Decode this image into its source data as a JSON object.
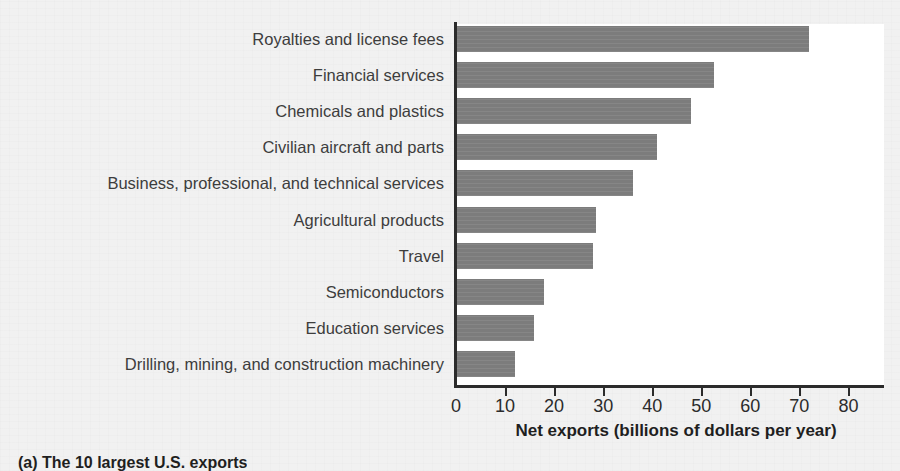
{
  "caption": "(a) The 10 largest U.S. exports",
  "axis": {
    "x_title": "Net exports (billions of dollars per year)",
    "ticks": [
      0,
      10,
      20,
      30,
      40,
      50,
      60,
      70,
      80
    ]
  },
  "colors": {
    "bar_fill": "#808080",
    "plot_background": "#ffffff",
    "page_background": "#f1f1f1",
    "label_text": "#3d3d3d",
    "axis": "#2b2b2b"
  },
  "chart_data": {
    "type": "bar",
    "orientation": "horizontal",
    "title": "",
    "subtitle": "",
    "xlabel": "Net exports (billions of dollars per year)",
    "ylabel": "",
    "xlim": [
      0,
      87
    ],
    "xticks": [
      0,
      10,
      20,
      30,
      40,
      50,
      60,
      70,
      80
    ],
    "grid": false,
    "legend": false,
    "categories": [
      "Royalties and license fees",
      "Financial services",
      "Chemicals and plastics",
      "Civilian aircraft and parts",
      "Business, professional, and technical services",
      "Agricultural products",
      "Travel",
      "Semiconductors",
      "Education services",
      "Drilling, mining, and construction machinery"
    ],
    "values": [
      72,
      52.5,
      48,
      41,
      36,
      28.5,
      28,
      18,
      16,
      12
    ],
    "units": "billions of dollars per year"
  }
}
